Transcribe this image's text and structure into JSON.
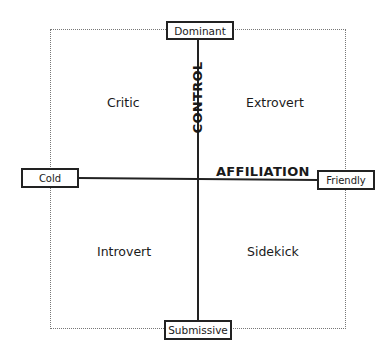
{
  "diagram": {
    "type": "interpersonal-circumplex-quadrant",
    "axes": {
      "vertical": {
        "label": "CONTROL",
        "top_pole": "Dominant",
        "bottom_pole": "Submissive"
      },
      "horizontal": {
        "label": "AFFILIATION",
        "left_pole": "Cold",
        "right_pole": "Friendly"
      }
    },
    "quadrants": {
      "top_left": "Critic",
      "top_right": "Extrovert",
      "bottom_left": "Introvert",
      "bottom_right": "Sidekick"
    },
    "colors": {
      "line": "#222222",
      "frame_dotted": "#777777",
      "background": "#ffffff"
    }
  }
}
